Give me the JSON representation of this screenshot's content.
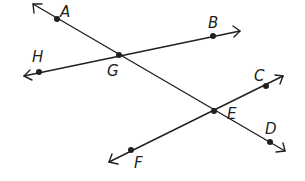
{
  "diagram": {
    "type": "geometry-lines",
    "colors": {
      "line": "#231f20",
      "background": "#ffffff"
    },
    "lines": [
      {
        "name": "line-AD",
        "through": [
          "A",
          "G",
          "E",
          "D"
        ],
        "from": [
          33,
          4
        ],
        "to": [
          285,
          151
        ]
      },
      {
        "name": "line-HB",
        "through": [
          "H",
          "G",
          "B"
        ],
        "from": [
          24,
          76
        ],
        "to": [
          240,
          31
        ]
      },
      {
        "name": "line-FC",
        "through": [
          "F",
          "E",
          "C"
        ],
        "from": [
          109,
          162
        ],
        "to": [
          283,
          76
        ]
      }
    ],
    "points": [
      {
        "id": "A",
        "label": "A",
        "x": 57,
        "y": 19,
        "lx": 60,
        "ly": 17
      },
      {
        "id": "B",
        "label": "B",
        "x": 213,
        "y": 36,
        "lx": 208,
        "ly": 28
      },
      {
        "id": "C",
        "label": "C",
        "x": 266,
        "y": 86,
        "lx": 254,
        "ly": 81
      },
      {
        "id": "D",
        "label": "D",
        "x": 270,
        "y": 142,
        "lx": 265,
        "ly": 134
      },
      {
        "id": "E",
        "label": "E",
        "x": 214,
        "y": 111,
        "lx": 227,
        "ly": 119
      },
      {
        "id": "F",
        "label": "F",
        "x": 131,
        "y": 150,
        "lx": 134,
        "ly": 168
      },
      {
        "id": "G",
        "label": "G",
        "x": 119,
        "y": 55,
        "lx": 107,
        "ly": 76
      },
      {
        "id": "H",
        "label": "H",
        "x": 39,
        "y": 72,
        "lx": 32,
        "ly": 62
      }
    ]
  }
}
